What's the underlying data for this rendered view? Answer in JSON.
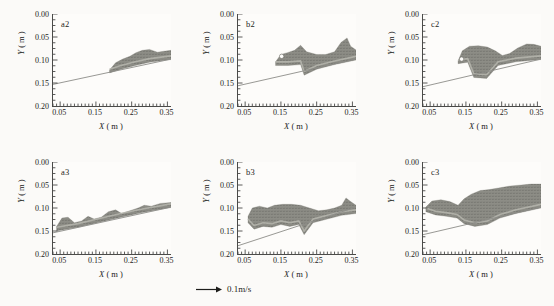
{
  "figure": {
    "axis_labels": {
      "x": "X",
      "y": "Y",
      "x_unit": "( m )",
      "y_unit": "( m )"
    },
    "scale_bar": {
      "label": "0.1m/s",
      "icon": "arrow-right-icon"
    },
    "colors": {
      "background": "#fbfaf8",
      "axis": "#4a4a48",
      "text": "#1d1d1b",
      "bed_line": "#8c8c88",
      "vector_fill": "#8d8d86",
      "vector_fill_dark": "#6f6f68",
      "vector_fill_light": "#b6b6ae"
    }
  },
  "chart_data": {
    "type": "scatter",
    "title": "",
    "xlabel": "X ( m )",
    "ylabel": "Y ( m )",
    "xlim": [
      0.03,
      0.36
    ],
    "ylim": [
      0.2,
      0.0
    ],
    "y_inverted": true,
    "grid": false,
    "legend": "none",
    "xticks": [
      0.05,
      0.15,
      0.25,
      0.35
    ],
    "xticklabels": [
      "0.05",
      "0.15",
      "0.25",
      "0.35"
    ],
    "yticks": [
      0.0,
      0.05,
      0.1,
      0.15,
      0.2
    ],
    "yticklabels": [
      "0.00",
      "0.05",
      "0.10",
      "0.15",
      "0.20"
    ],
    "minor_tick_spacing_x": 0.01,
    "minor_tick_spacing_y": 0.0125,
    "scale_vector": {
      "magnitude": 0.1,
      "units": "m/s",
      "label": "0.1m/s"
    },
    "panels": [
      {
        "id": "a2",
        "label": "a2",
        "row": 0,
        "col": 0,
        "bed_line": {
          "x0": 0.03,
          "y0": 0.153,
          "x1": 0.36,
          "y1": 0.098
        },
        "flow_region": {
          "description": "thin sheared jet layer hugging the bed from x=0.19 to x=0.36, with three low crests",
          "x_start": 0.188,
          "x_end": 0.36,
          "upper_boundary": [
            [
              0.188,
              0.122
            ],
            [
              0.205,
              0.106
            ],
            [
              0.225,
              0.098
            ],
            [
              0.245,
              0.092
            ],
            [
              0.262,
              0.084
            ],
            [
              0.28,
              0.079
            ],
            [
              0.3,
              0.077
            ],
            [
              0.322,
              0.083
            ],
            [
              0.34,
              0.081
            ],
            [
              0.36,
              0.079
            ]
          ],
          "lower_boundary": [
            [
              0.188,
              0.128
            ],
            [
              0.22,
              0.12
            ],
            [
              0.26,
              0.112
            ],
            [
              0.3,
              0.105
            ],
            [
              0.36,
              0.099
            ]
          ]
        }
      },
      {
        "id": "b2",
        "label": "b2",
        "row": 0,
        "col": 1,
        "bed_line": {
          "x0": 0.03,
          "y0": 0.156,
          "x1": 0.36,
          "y1": 0.098
        },
        "flow_region": {
          "description": "roller vortex near x=0.15-0.22 with detached eddy, step at x=0.215 down to bed, tall plume at x=0.33",
          "x_start": 0.135,
          "x_end": 0.36,
          "upper_boundary": [
            [
              0.135,
              0.104
            ],
            [
              0.15,
              0.088
            ],
            [
              0.168,
              0.084
            ],
            [
              0.188,
              0.079
            ],
            [
              0.205,
              0.068
            ],
            [
              0.222,
              0.082
            ],
            [
              0.25,
              0.088
            ],
            [
              0.275,
              0.088
            ],
            [
              0.3,
              0.082
            ],
            [
              0.318,
              0.062
            ],
            [
              0.335,
              0.052
            ],
            [
              0.345,
              0.07
            ],
            [
              0.36,
              0.078
            ]
          ],
          "lower_boundary": [
            [
              0.135,
              0.112
            ],
            [
              0.17,
              0.112
            ],
            [
              0.205,
              0.11
            ],
            [
              0.215,
              0.133
            ],
            [
              0.25,
              0.12
            ],
            [
              0.3,
              0.11
            ],
            [
              0.36,
              0.1
            ]
          ],
          "vortex_center": [
            0.152,
            0.092
          ]
        }
      },
      {
        "id": "c2",
        "label": "c2",
        "row": 0,
        "col": 2,
        "bed_line": {
          "x0": 0.03,
          "y0": 0.158,
          "x1": 0.36,
          "y1": 0.098
        },
        "flow_region": {
          "description": "large breaking roller from x=0.13 to 0.24 with head, block plunge at x=0.17-0.21, trailing jet to x=0.36",
          "x_start": 0.128,
          "x_end": 0.36,
          "upper_boundary": [
            [
              0.128,
              0.102
            ],
            [
              0.14,
              0.08
            ],
            [
              0.16,
              0.07
            ],
            [
              0.185,
              0.069
            ],
            [
              0.21,
              0.072
            ],
            [
              0.232,
              0.08
            ],
            [
              0.252,
              0.09
            ],
            [
              0.272,
              0.086
            ],
            [
              0.295,
              0.074
            ],
            [
              0.32,
              0.065
            ],
            [
              0.34,
              0.066
            ],
            [
              0.36,
              0.07
            ]
          ],
          "lower_boundary": [
            [
              0.128,
              0.108
            ],
            [
              0.155,
              0.105
            ],
            [
              0.172,
              0.138
            ],
            [
              0.208,
              0.14
            ],
            [
              0.24,
              0.112
            ],
            [
              0.29,
              0.104
            ],
            [
              0.36,
              0.099
            ]
          ],
          "vortex_center": [
            0.138,
            0.098
          ]
        }
      },
      {
        "id": "a3",
        "label": "a3",
        "row": 1,
        "col": 0,
        "bed_line": {
          "x0": 0.03,
          "y0": 0.154,
          "x1": 0.36,
          "y1": 0.098
        },
        "flow_region": {
          "description": "bed-attached layer spanning full width with a bulbous head at x=0.06 and four crests downstream",
          "x_start": 0.04,
          "x_end": 0.36,
          "upper_boundary": [
            [
              0.04,
              0.14
            ],
            [
              0.055,
              0.122
            ],
            [
              0.072,
              0.12
            ],
            [
              0.09,
              0.132
            ],
            [
              0.11,
              0.128
            ],
            [
              0.128,
              0.118
            ],
            [
              0.145,
              0.124
            ],
            [
              0.165,
              0.12
            ],
            [
              0.185,
              0.108
            ],
            [
              0.205,
              0.104
            ],
            [
              0.222,
              0.112
            ],
            [
              0.245,
              0.106
            ],
            [
              0.268,
              0.1
            ],
            [
              0.285,
              0.094
            ],
            [
              0.305,
              0.096
            ],
            [
              0.33,
              0.09
            ],
            [
              0.36,
              0.088
            ]
          ],
          "lower_boundary": [
            [
              0.04,
              0.15
            ],
            [
              0.1,
              0.142
            ],
            [
              0.16,
              0.131
            ],
            [
              0.22,
              0.12
            ],
            [
              0.28,
              0.11
            ],
            [
              0.36,
              0.099
            ]
          ]
        }
      },
      {
        "id": "b3",
        "label": "b3",
        "row": 1,
        "col": 1,
        "bed_line": {
          "x0": 0.03,
          "y0": 0.182,
          "x1": 0.36,
          "y1": 0.098
        },
        "flow_region": {
          "description": "thick turbulent bore occupying x=0.06-0.36, flat top near y=0.095, deep lobes to y=0.145, step at x=0.215, tall spike at x=0.335",
          "x_start": 0.058,
          "x_end": 0.36,
          "upper_boundary": [
            [
              0.058,
              0.118
            ],
            [
              0.07,
              0.1
            ],
            [
              0.09,
              0.096
            ],
            [
              0.112,
              0.1
            ],
            [
              0.132,
              0.094
            ],
            [
              0.155,
              0.092
            ],
            [
              0.18,
              0.092
            ],
            [
              0.205,
              0.094
            ],
            [
              0.23,
              0.1
            ],
            [
              0.255,
              0.106
            ],
            [
              0.278,
              0.104
            ],
            [
              0.3,
              0.1
            ],
            [
              0.32,
              0.094
            ],
            [
              0.332,
              0.078
            ],
            [
              0.345,
              0.086
            ],
            [
              0.36,
              0.094
            ]
          ],
          "lower_boundary": [
            [
              0.058,
              0.132
            ],
            [
              0.075,
              0.146
            ],
            [
              0.1,
              0.14
            ],
            [
              0.125,
              0.142
            ],
            [
              0.15,
              0.136
            ],
            [
              0.175,
              0.14
            ],
            [
              0.2,
              0.136
            ],
            [
              0.215,
              0.158
            ],
            [
              0.24,
              0.132
            ],
            [
              0.28,
              0.124
            ],
            [
              0.32,
              0.116
            ],
            [
              0.36,
              0.112
            ]
          ]
        }
      },
      {
        "id": "c3",
        "label": "c3",
        "row": 1,
        "col": 2,
        "bed_line": {
          "x0": 0.03,
          "y0": 0.158,
          "x1": 0.36,
          "y1": 0.098
        },
        "flow_region": {
          "description": "deep surging bore, surface rising from y=0.095 at left to y=0.048 at right edge, nose lobe at x=0.05-0.14, block at x=0.17-0.22",
          "x_start": 0.038,
          "x_end": 0.36,
          "upper_boundary": [
            [
              0.038,
              0.098
            ],
            [
              0.055,
              0.085
            ],
            [
              0.08,
              0.082
            ],
            [
              0.105,
              0.086
            ],
            [
              0.128,
              0.094
            ],
            [
              0.145,
              0.08
            ],
            [
              0.165,
              0.07
            ],
            [
              0.19,
              0.062
            ],
            [
              0.215,
              0.06
            ],
            [
              0.245,
              0.056
            ],
            [
              0.275,
              0.052
            ],
            [
              0.305,
              0.05
            ],
            [
              0.332,
              0.048
            ],
            [
              0.36,
              0.048
            ]
          ],
          "lower_boundary": [
            [
              0.038,
              0.108
            ],
            [
              0.065,
              0.115
            ],
            [
              0.095,
              0.118
            ],
            [
              0.125,
              0.122
            ],
            [
              0.145,
              0.134
            ],
            [
              0.175,
              0.14
            ],
            [
              0.21,
              0.136
            ],
            [
              0.245,
              0.122
            ],
            [
              0.29,
              0.112
            ],
            [
              0.36,
              0.1
            ]
          ]
        }
      }
    ]
  }
}
